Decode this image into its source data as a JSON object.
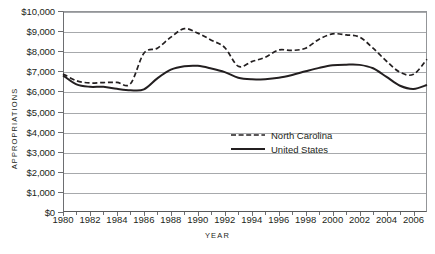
{
  "chart_data": {
    "type": "line",
    "title": "",
    "xlabel": "YEAR",
    "ylabel": "APPROPRIATIONS",
    "xlim": [
      1980,
      2007
    ],
    "ylim": [
      0,
      10000
    ],
    "grid": true,
    "legend_position": "center",
    "x": [
      1980,
      1981,
      1982,
      1983,
      1984,
      1985,
      1986,
      1987,
      1988,
      1989,
      1990,
      1991,
      1992,
      1993,
      1994,
      1995,
      1996,
      1997,
      1998,
      1999,
      2000,
      2001,
      2002,
      2003,
      2004,
      2005,
      2006,
      2007
    ],
    "y_ticks": [
      0,
      1000,
      2000,
      3000,
      4000,
      5000,
      6000,
      7000,
      8000,
      9000,
      10000
    ],
    "y_ticklabels": [
      "$0",
      "$1,000",
      "$2,000",
      "$3,000",
      "$4,000",
      "$5,000",
      "$6,000",
      "$7,000",
      "$8,000",
      "$9,000",
      "$10,000"
    ],
    "x_ticks": [
      1980,
      1982,
      1984,
      1986,
      1988,
      1990,
      1992,
      1994,
      1996,
      1998,
      2000,
      2002,
      2004,
      2006
    ],
    "x_ticklabels": [
      "1980",
      "1982",
      "1984",
      "1986",
      "1988",
      "1990",
      "1992",
      "1994",
      "1996",
      "1998",
      "2000",
      "2002",
      "2004",
      "2006"
    ],
    "series": [
      {
        "name": "North Carolina",
        "style": "dashed",
        "color": "#231f20",
        "values": [
          6870,
          6530,
          6420,
          6440,
          6450,
          6380,
          7900,
          8150,
          8700,
          9120,
          8900,
          8550,
          8180,
          7250,
          7480,
          7700,
          8060,
          8040,
          8150,
          8600,
          8860,
          8810,
          8700,
          8150,
          7500,
          6950,
          6850,
          7600
        ]
      },
      {
        "name": "United States",
        "style": "solid",
        "color": "#231f20",
        "values": [
          6800,
          6350,
          6230,
          6230,
          6130,
          6060,
          6100,
          6650,
          7080,
          7250,
          7270,
          7140,
          6960,
          6680,
          6600,
          6610,
          6680,
          6820,
          7000,
          7170,
          7300,
          7330,
          7320,
          7150,
          6720,
          6280,
          6120,
          6320
        ]
      }
    ]
  },
  "legend": {
    "entries": [
      {
        "label": "North Carolina",
        "style": "dashed"
      },
      {
        "label": "United States",
        "style": "solid"
      }
    ]
  }
}
